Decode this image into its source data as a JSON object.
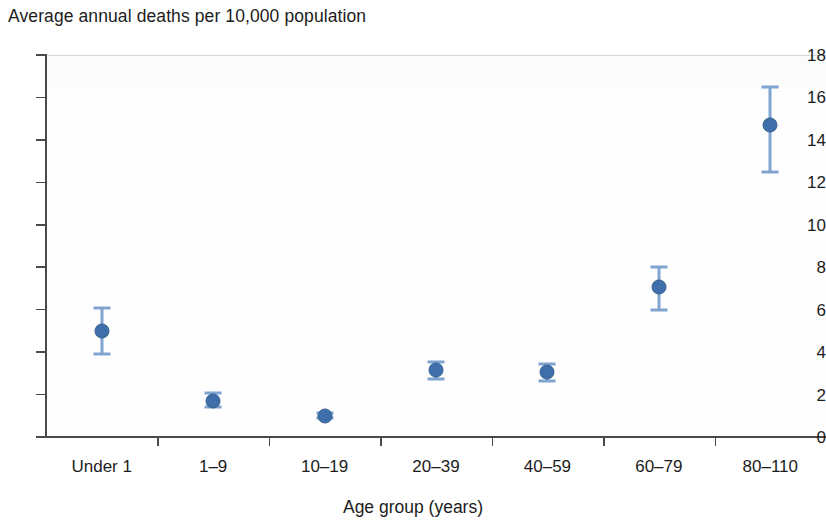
{
  "chart_data": {
    "type": "scatter",
    "title": "Average annual deaths per 10,000 population",
    "xlabel": "Age group (years)",
    "ylabel": "",
    "categories": [
      "Under 1",
      "1–9",
      "10–19",
      "20–39",
      "40–59",
      "60–79",
      "80–110"
    ],
    "values": [
      5.0,
      1.7,
      1.0,
      3.15,
      3.05,
      7.05,
      14.7
    ],
    "error_low": [
      3.9,
      1.4,
      0.9,
      2.75,
      2.65,
      6.0,
      12.5
    ],
    "error_high": [
      6.1,
      2.05,
      1.15,
      3.55,
      3.45,
      8.0,
      16.5
    ],
    "ylim": [
      0,
      18
    ],
    "yticks": [
      0,
      2,
      4,
      6,
      8,
      10,
      12,
      14,
      16,
      18
    ],
    "ytick_labels": [
      "0",
      "2",
      "4",
      "6",
      "8",
      "10",
      "12",
      "14",
      "16",
      "18"
    ],
    "grid": false,
    "legend": "none",
    "marker_color": "#3f6fab",
    "errorbar_color": "#7fa4cf",
    "axis_color": "#4a4a4a",
    "series": [
      {
        "name": "Average annual deaths per 10,000 population",
        "points": [
          {
            "category": "Under 1",
            "value": 5.0,
            "ci_low": 3.9,
            "ci_high": 6.1
          },
          {
            "category": "1–9",
            "value": 1.7,
            "ci_low": 1.4,
            "ci_high": 2.05
          },
          {
            "category": "10–19",
            "value": 1.0,
            "ci_low": 0.9,
            "ci_high": 1.15
          },
          {
            "category": "20–39",
            "value": 3.15,
            "ci_low": 2.75,
            "ci_high": 3.55
          },
          {
            "category": "40–59",
            "value": 3.05,
            "ci_low": 2.65,
            "ci_high": 3.45
          },
          {
            "category": "60–79",
            "value": 7.05,
            "ci_low": 6.0,
            "ci_high": 8.0
          },
          {
            "category": "80–110",
            "value": 14.7,
            "ci_low": 12.5,
            "ci_high": 16.5
          }
        ]
      }
    ]
  }
}
